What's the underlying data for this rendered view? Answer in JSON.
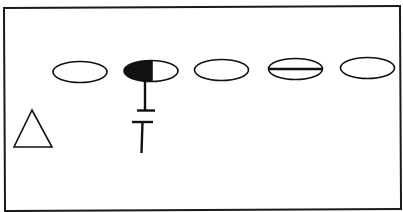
{
  "diagram": {
    "type": "pedigree-like symbol diagram",
    "frame": {
      "stroke": "#1a1a1a"
    },
    "colors": {
      "stroke": "#111111",
      "fill": "#111111",
      "background": "#ffffff"
    },
    "symbols": [
      {
        "id": "ellipse-1",
        "shape": "ellipse",
        "style": "open",
        "label": "open ellipse"
      },
      {
        "id": "ellipse-2",
        "shape": "ellipse",
        "style": "left-half-filled",
        "label": "half-filled ellipse"
      },
      {
        "id": "ellipse-3",
        "shape": "ellipse",
        "style": "open",
        "label": "open ellipse"
      },
      {
        "id": "ellipse-4",
        "shape": "ellipse",
        "style": "horizontal-line",
        "label": "ellipse with horizontal bar"
      },
      {
        "id": "ellipse-5",
        "shape": "ellipse",
        "style": "open",
        "label": "open ellipse"
      },
      {
        "id": "triangle-1",
        "shape": "triangle",
        "style": "open",
        "label": "open triangle"
      }
    ],
    "connectors": [
      {
        "id": "descent-line",
        "from": "ellipse-2",
        "style": "line with broken double bar (T-junction gap)"
      }
    ]
  }
}
